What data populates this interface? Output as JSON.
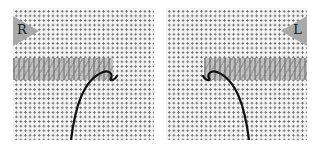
{
  "figure": {
    "panels": [
      {
        "id": "right-handed",
        "badge_label": "R",
        "badge_side": "left",
        "stitch_band_direction": "worked left to right"
      },
      {
        "id": "left-handed",
        "badge_label": "L",
        "badge_side": "right",
        "stitch_band_direction": "worked right to left"
      }
    ],
    "colors": {
      "canvas_background": "#f4f4f4",
      "canvas_dots": "#6e6e6e",
      "stitch_band": "#8a8a8a",
      "badge": "#a9a9a9",
      "thread": "#111111"
    }
  }
}
